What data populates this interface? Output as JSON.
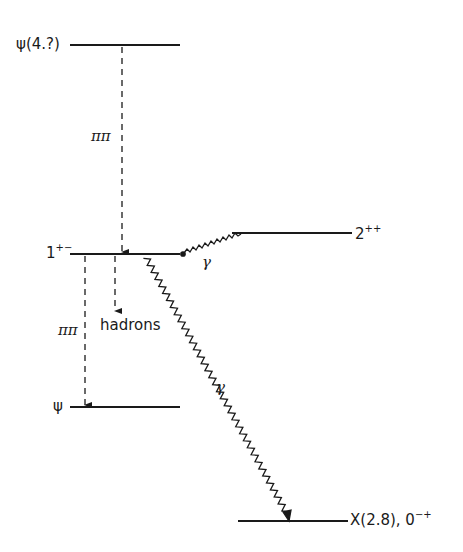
{
  "diagram": {
    "colors": {
      "ink": "#1a1a1a",
      "background": "#ffffff"
    },
    "levels": [
      {
        "id": "psi4",
        "base": "ψ(4.?)",
        "sup": ""
      },
      {
        "id": "onepm",
        "base": "1",
        "sup": "+−"
      },
      {
        "id": "twopp",
        "base": "2",
        "sup": "++"
      },
      {
        "id": "psi",
        "base": "ψ",
        "sup": ""
      },
      {
        "id": "x28",
        "base": "X(2.8), 0",
        "sup": "−+"
      }
    ],
    "transitions": [
      {
        "from": "ψ(4.?)",
        "to": "1+−",
        "label": "ππ",
        "style": "dashed"
      },
      {
        "from": "1+−",
        "to": "2++",
        "label": "γ",
        "style": "wavy"
      },
      {
        "from": "1+−",
        "to": "hadrons",
        "label": "hadrons",
        "style": "dashed"
      },
      {
        "from": "1+−",
        "to": "ψ",
        "label": "ππ",
        "style": "dashed"
      },
      {
        "from": "1+−",
        "to": "X(2.8), 0−+",
        "label": "γ",
        "style": "wavy"
      }
    ]
  }
}
